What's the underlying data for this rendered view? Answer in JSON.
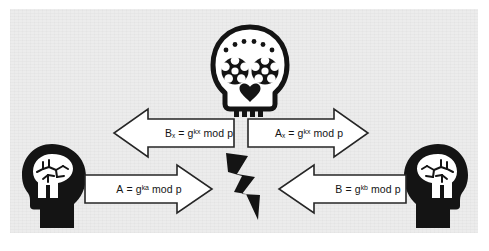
{
  "diagram": {
    "background_color": "#ececec",
    "page_color": "#ffffff",
    "ink_color": "#141414"
  },
  "actors": {
    "left": {
      "name": "left-participant",
      "icon": "head-with-brain-icon",
      "facing": "right"
    },
    "right": {
      "name": "right-participant",
      "icon": "head-with-brain-icon",
      "facing": "left"
    },
    "attacker": {
      "name": "attacker",
      "icon": "sugar-skull-icon"
    },
    "center": {
      "name": "interception-point",
      "icon": "lightning-bolt-icon"
    }
  },
  "messages": [
    {
      "id": "upper-left",
      "direction": "left",
      "base": "B",
      "base_sub": "x",
      "equals": " = g",
      "exponent": "kx",
      "modulus": " mod p",
      "text": "Bx = g^kx mod p"
    },
    {
      "id": "upper-right",
      "direction": "right",
      "base": "A",
      "base_sub": "x",
      "equals": " = g",
      "exponent": "kx",
      "modulus": " mod p",
      "text": "Ax = g^kx mod p"
    },
    {
      "id": "lower-left",
      "direction": "right",
      "base": "A",
      "base_sub": "",
      "equals": " = g",
      "exponent": "ka",
      "modulus": " mod p",
      "text": "A = g^ka mod p"
    },
    {
      "id": "lower-right",
      "direction": "left",
      "base": "B",
      "base_sub": "",
      "equals": " = g",
      "exponent": "kb",
      "modulus": " mod p",
      "text": "B = g^kb mod p"
    }
  ]
}
